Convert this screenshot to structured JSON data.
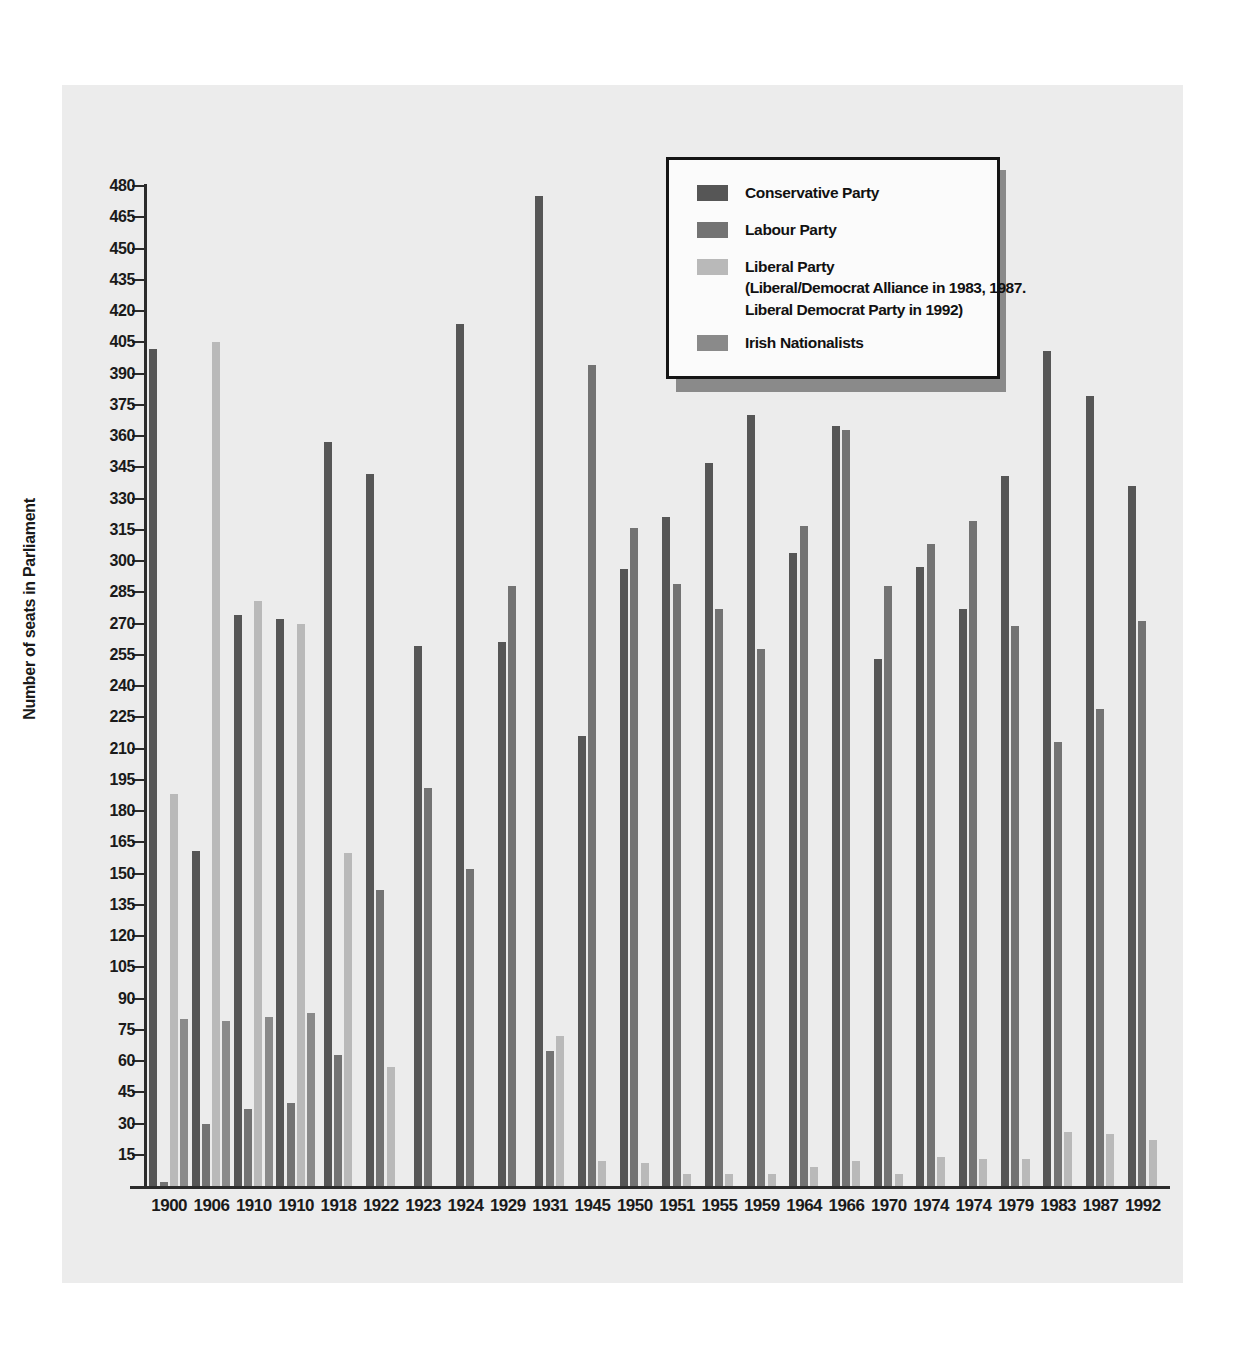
{
  "chart_data": {
    "type": "bar",
    "title": "",
    "xlabel": "",
    "ylabel": "Number of seats in Parliament",
    "ylim": [
      0,
      480
    ],
    "ytick_step": 15,
    "yticks": [
      480,
      465,
      450,
      435,
      420,
      405,
      390,
      375,
      360,
      345,
      330,
      315,
      300,
      285,
      270,
      255,
      240,
      225,
      210,
      195,
      180,
      165,
      150,
      135,
      120,
      105,
      90,
      75,
      60,
      45,
      30,
      15
    ],
    "grid": false,
    "legend_position": "top-right",
    "categories": [
      "1900",
      "1906",
      "1910",
      "1910",
      "1918",
      "1922",
      "1923",
      "1924",
      "1929",
      "1931",
      "1945",
      "1950",
      "1951",
      "1955",
      "1959",
      "1964",
      "1966",
      "1970",
      "1974",
      "1974",
      "1979",
      "1983",
      "1987",
      "1992"
    ],
    "series": [
      {
        "name": "Conservative Party",
        "color": "#565656",
        "values": [
          402,
          161,
          274,
          272,
          357,
          342,
          259,
          414,
          261,
          475,
          216,
          296,
          321,
          347,
          370,
          304,
          365,
          253,
          297,
          277,
          341,
          401,
          379,
          336
        ]
      },
      {
        "name": "Labour Party",
        "color": "#737373",
        "values": [
          2,
          30,
          37,
          40,
          63,
          142,
          191,
          152,
          288,
          65,
          394,
          316,
          289,
          277,
          258,
          317,
          363,
          288,
          308,
          319,
          269,
          213,
          229,
          271
        ]
      },
      {
        "name": "Liberal Party",
        "color": "#b9b9b9",
        "values": [
          188,
          405,
          281,
          270,
          160,
          57,
          0,
          0,
          0,
          72,
          12,
          11,
          6,
          6,
          6,
          9,
          12,
          6,
          14,
          13,
          13,
          26,
          25,
          22
        ]
      },
      {
        "name": "Irish Nationalists",
        "color": "#8a8a8a",
        "values": [
          80,
          79,
          81,
          83,
          0,
          0,
          0,
          0,
          0,
          0,
          0,
          0,
          0,
          0,
          0,
          0,
          0,
          0,
          0,
          0,
          0,
          0,
          0,
          0
        ]
      }
    ],
    "legend": {
      "entries": [
        {
          "label": "Conservative Party",
          "color": "#565656",
          "note": ""
        },
        {
          "label": "Labour Party",
          "color": "#737373",
          "note": ""
        },
        {
          "label": "Liberal Party",
          "color": "#b9b9b9",
          "note_line1": "(Liberal/Democrat Alliance in 1983, 1987.",
          "note_line2": "Liberal Democrat Party in 1992)"
        },
        {
          "label": "Irish Nationalists",
          "color": "#8a8a8a",
          "note": ""
        }
      ]
    }
  }
}
